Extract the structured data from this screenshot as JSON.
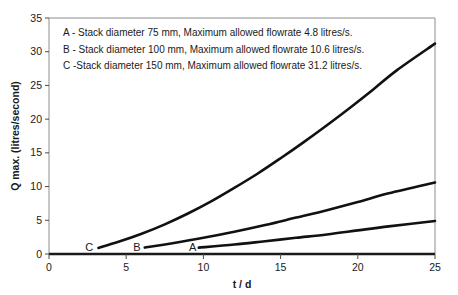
{
  "chart_data": {
    "type": "line",
    "title": "",
    "subtitle": "",
    "xlabel": "t / d",
    "ylabel": "Q max. (litres/second)",
    "xlim": [
      0,
      25
    ],
    "ylim": [
      0,
      35
    ],
    "xticks": [
      "0",
      "5",
      "10",
      "15",
      "20",
      "25"
    ],
    "yticks": [
      "0",
      "5",
      "10",
      "15",
      "20",
      "25",
      "30",
      "35"
    ],
    "grid": false,
    "legend_position": "inside-top-left",
    "legend": [
      "A - Stack diameter 75 mm,  Maximum allowed flowrate 4.8 litres/s.",
      "B - Stack diameter 100 mm,  Maximum allowed flowrate 10.6 litres/s.",
      "C -Stack diameter 150 mm,  Maximum allowed flowrate 31.2 litres/s."
    ],
    "annotations": [
      {
        "text": "C",
        "x": 2.6,
        "y": 1.0
      },
      {
        "text": "B",
        "x": 5.7,
        "y": 1.0
      },
      {
        "text": "A",
        "x": 9.3,
        "y": 1.0
      }
    ],
    "series": [
      {
        "name": "C",
        "label": "Stack diameter 150 mm",
        "stack_diameter_mm": 150,
        "max_allowed_flowrate_litres_per_s": 31.2,
        "color": "#111111",
        "x": [
          3.2,
          4.5,
          6.0,
          7.5,
          9.0,
          10.5,
          12.0,
          13.5,
          15.0,
          16.5,
          18.0,
          19.5,
          21.0,
          22.5,
          25.0
        ],
        "y": [
          0.9,
          1.8,
          3.0,
          4.4,
          6.0,
          7.8,
          9.8,
          11.9,
          14.2,
          16.6,
          19.1,
          21.7,
          24.4,
          27.2,
          31.2
        ]
      },
      {
        "name": "B",
        "label": "Stack diameter 100 mm",
        "stack_diameter_mm": 100,
        "max_allowed_flowrate_litres_per_s": 10.6,
        "color": "#111111",
        "x": [
          6.2,
          8.0,
          10.0,
          12.0,
          14.0,
          16.0,
          18.0,
          20.0,
          22.0,
          25.0
        ],
        "y": [
          0.95,
          1.6,
          2.4,
          3.3,
          4.3,
          5.4,
          6.5,
          7.7,
          9.0,
          10.6
        ]
      },
      {
        "name": "A",
        "label": "Stack diameter 75 mm",
        "stack_diameter_mm": 75,
        "max_allowed_flowrate_litres_per_s": 4.8,
        "color": "#111111",
        "x": [
          9.7,
          12.0,
          14.0,
          16.0,
          18.0,
          20.0,
          22.0,
          25.0
        ],
        "y": [
          0.95,
          1.4,
          1.9,
          2.4,
          2.9,
          3.5,
          4.1,
          4.9
        ]
      }
    ]
  }
}
